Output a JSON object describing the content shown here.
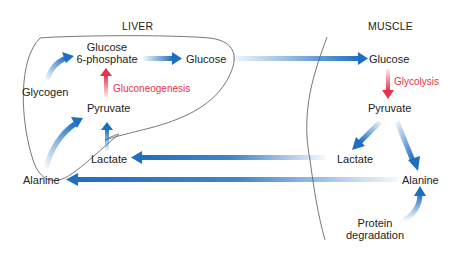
{
  "diagram": {
    "type": "metabolic pathway diagram",
    "regions": {
      "liver": {
        "label": "LIVER"
      },
      "muscle": {
        "label": "MUSCLE"
      }
    },
    "nodes": {
      "liver_glucose6p": "Glucose\n6-phosphate",
      "liver_glucose6p_line1": "Glucose",
      "liver_glucose6p_line2": "6-phosphate",
      "liver_glucose": "Glucose",
      "liver_glycogen": "Glycogen",
      "liver_pyruvate": "Pyruvate",
      "liver_lactate": "Lactate",
      "liver_alanine": "Alanine",
      "muscle_glucose": "Glucose",
      "muscle_pyruvate": "Pyruvate",
      "muscle_lactate": "Lactate",
      "muscle_alanine": "Alanine",
      "muscle_protein_line1": "Protein",
      "muscle_protein_line2": "degradation"
    },
    "process_labels": {
      "gluconeogenesis": "Gluconeogenesis",
      "glycolysis": "Glycolysis"
    },
    "edges": [
      {
        "from": "Glycogen",
        "to": "Glucose 6-phosphate",
        "color": "blue"
      },
      {
        "from": "Pyruvate",
        "to": "Glucose 6-phosphate",
        "color": "red",
        "label": "Gluconeogenesis"
      },
      {
        "from": "Glucose 6-phosphate",
        "to": "Glucose (liver)",
        "color": "blue"
      },
      {
        "from": "Glucose (liver)",
        "to": "Glucose (muscle)",
        "color": "blue"
      },
      {
        "from": "Glucose (muscle)",
        "to": "Pyruvate (muscle)",
        "color": "red",
        "label": "Glycolysis"
      },
      {
        "from": "Pyruvate (muscle)",
        "to": "Lactate (muscle)",
        "color": "blue"
      },
      {
        "from": "Pyruvate (muscle)",
        "to": "Alanine (muscle)",
        "color": "blue"
      },
      {
        "from": "Protein degradation",
        "to": "Alanine (muscle)",
        "color": "blue"
      },
      {
        "from": "Lactate (muscle)",
        "to": "Lactate (liver)",
        "color": "blue"
      },
      {
        "from": "Alanine (muscle)",
        "to": "Alanine (liver)",
        "color": "blue"
      },
      {
        "from": "Lactate (liver)",
        "to": "Pyruvate (liver)",
        "color": "blue"
      },
      {
        "from": "Alanine (liver)",
        "to": "Pyruvate (liver)",
        "color": "blue"
      }
    ],
    "colors": {
      "arrow_blue": "#1f6fc0",
      "arrow_red": "#e8324a",
      "outline": "#777777",
      "text": "#222222"
    }
  }
}
